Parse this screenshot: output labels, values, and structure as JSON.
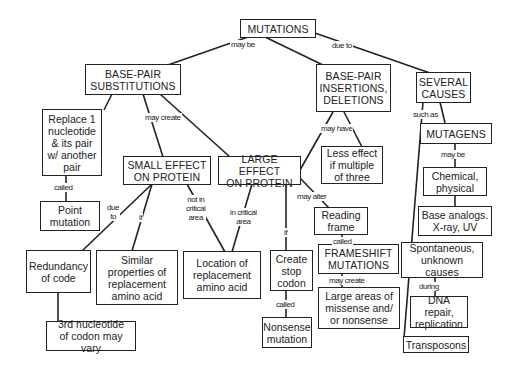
{
  "diagram": {
    "type": "concept-map",
    "nodes": {
      "mutations": "MUTATIONS",
      "substitutions": "BASE-PAIR\nSUBSTITUTIONS",
      "insertions": "BASE-PAIR\nINSERTIONS,\nDELETIONS",
      "causes": "SEVERAL\nCAUSES",
      "replace": "Replace 1\nnucleotide\n& its pair\nw/ another\npair",
      "point": "Point\nmutation",
      "small": "SMALL EFFECT\nON PROTEIN",
      "large": "LARGE EFFECT\nON PROTEIN",
      "less_effect": "Less effect\nif multiple\nof three",
      "mutagens": "MUTAGENS",
      "chemical": "Chemical,\nphysical",
      "base_analogs": "Base analogs.\nX-ray, UV",
      "redundancy": "Redundancy\nof code",
      "similar": "Similar\nproperties of\nreplacement\namino acid",
      "location": "Location of\nreplacement\namino acid",
      "stop_codon": "Create\nstop\ncodon",
      "reading_frame": "Reading\nframe",
      "frameshift": "FRAMESHIFT\nMUTATIONS",
      "spontaneous": "Spontaneous,\nunknown\ncauses",
      "third_nucleotide": "3rd nucleotide\nof codon may vary",
      "nonsense": "Nonsense\nmutation",
      "large_areas": "Large areas of\nmissense and/\nor nonsense",
      "dna_repair": "DNA repair,\nreplication",
      "transposons": "Transposons"
    },
    "links": {
      "may_be": "may be",
      "due_to_top": "due to",
      "may_create_sub": "may create",
      "called_point": "called",
      "may_have": "may have",
      "such_as": "such as",
      "may_be_mutagens": "may be",
      "due_to_small": "due\nto",
      "if_small": "if",
      "not_critical": "not in\ncritical\narea",
      "in_critical": "in critical\narea",
      "if_large": "if",
      "may_alter": "may alter",
      "called_frame": "called",
      "called_nonsense": "called",
      "may_create_frame": "may create",
      "during": "during"
    }
  }
}
